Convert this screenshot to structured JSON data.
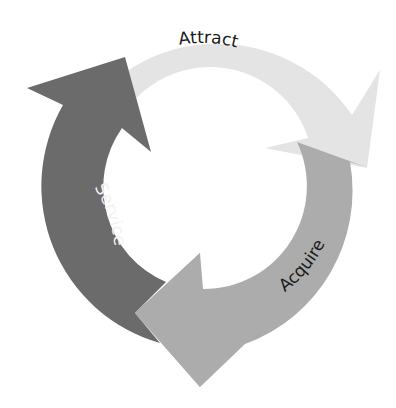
{
  "diagram": {
    "type": "cycle",
    "center": [
      204,
      186
    ],
    "outer_radius": 163,
    "inner_radius": 103,
    "stages": [
      {
        "label": "Attract",
        "color": "#e4e4e4",
        "text_color": "#1a1a1a"
      },
      {
        "label": "Acquire",
        "color": "#acacac",
        "text_color": "#1a1a1a"
      },
      {
        "label": "Service",
        "color": "#6b6b6b",
        "text_color": "#f2f2f2"
      }
    ]
  }
}
